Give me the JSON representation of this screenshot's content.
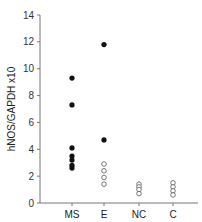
{
  "chart_data": {
    "type": "scatter",
    "title": "",
    "xlabel": "",
    "ylabel": "hNOS/GAPDH x10",
    "ylim": [
      0,
      14
    ],
    "yticks": [
      0,
      2,
      4,
      6,
      8,
      10,
      12,
      14
    ],
    "categories": [
      "MS",
      "E",
      "NC",
      "C"
    ],
    "grid": false,
    "legend": "none",
    "series": [
      {
        "name": "filled",
        "marker": "filled-circle",
        "color": "#111111",
        "points": [
          {
            "category": "MS",
            "value": 9.3
          },
          {
            "category": "MS",
            "value": 7.3
          },
          {
            "category": "MS",
            "value": 4.1
          },
          {
            "category": "MS",
            "value": 3.5
          },
          {
            "category": "MS",
            "value": 3.2
          },
          {
            "category": "MS",
            "value": 2.8
          },
          {
            "category": "MS",
            "value": 2.6
          },
          {
            "category": "E",
            "value": 11.8
          },
          {
            "category": "E",
            "value": 4.7
          }
        ]
      },
      {
        "name": "open",
        "marker": "open-circle",
        "color": "#555555",
        "points": [
          {
            "category": "E",
            "value": 2.9
          },
          {
            "category": "E",
            "value": 2.4
          },
          {
            "category": "E",
            "value": 1.9
          },
          {
            "category": "E",
            "value": 1.4
          },
          {
            "category": "NC",
            "value": 1.4
          },
          {
            "category": "NC",
            "value": 1.2
          },
          {
            "category": "NC",
            "value": 1.0
          },
          {
            "category": "NC",
            "value": 0.7
          },
          {
            "category": "C",
            "value": 1.5
          },
          {
            "category": "C",
            "value": 1.2
          },
          {
            "category": "C",
            "value": 0.9
          },
          {
            "category": "C",
            "value": 0.6
          }
        ]
      }
    ]
  }
}
